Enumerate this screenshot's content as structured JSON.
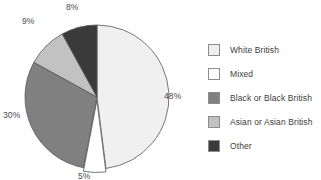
{
  "chart_data": {
    "type": "pie",
    "title": "",
    "subtitle": "",
    "xlabel": "",
    "ylabel": "",
    "grid": false,
    "legend_position": "right",
    "start_angle_deg": 0,
    "direction": "clockwise",
    "categories": [
      "White British",
      "Mixed",
      "Black or Black British",
      "Asian or Asian British",
      "Other"
    ],
    "values": [
      48,
      5,
      30,
      9,
      8
    ],
    "data_labels": [
      "48%",
      "5%",
      "30%",
      "9%",
      "8%"
    ],
    "colors": [
      "#f0f0f0",
      "#ffffff",
      "#808080",
      "#c2c2c2",
      "#3a3a3a"
    ],
    "slice_outline_color": "#555555",
    "exploded_slices": [
      "Mixed"
    ],
    "annotations": []
  },
  "pie": {
    "slices": [
      {
        "label": "White British",
        "percent": 48,
        "data_label": "48%",
        "color": "#f0f0f0"
      },
      {
        "label": "Mixed",
        "percent": 5,
        "data_label": "5%",
        "color": "#ffffff"
      },
      {
        "label": "Black or Black British",
        "percent": 30,
        "data_label": "30%",
        "color": "#808080"
      },
      {
        "label": "Asian or Asian British",
        "percent": 9,
        "data_label": "9%",
        "color": "#c2c2c2"
      },
      {
        "label": "Other",
        "percent": 8,
        "data_label": "8%",
        "color": "#3a3a3a"
      }
    ],
    "labels": {
      "white_british": "48%",
      "mixed": "5%",
      "black_british": "30%",
      "asian_british": "9%",
      "other": "8%"
    }
  },
  "legend": {
    "items": [
      {
        "label": "White British",
        "color": "#f0f0f0"
      },
      {
        "label": "Mixed",
        "color": "#ffffff"
      },
      {
        "label": "Black or Black British",
        "color": "#808080"
      },
      {
        "label": "Asian or Asian British",
        "color": "#c2c2c2"
      },
      {
        "label": "Other",
        "color": "#3a3a3a"
      }
    ]
  }
}
